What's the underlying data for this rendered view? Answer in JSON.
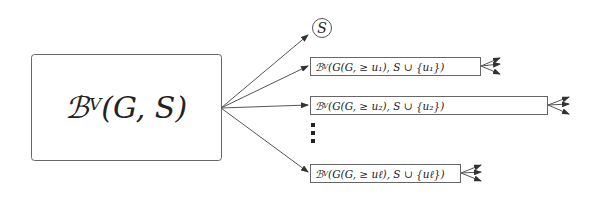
{
  "diagram": {
    "root": {
      "base": "ℬ",
      "superscript": "V",
      "args": " (G, S)"
    },
    "leaf": {
      "label": "S"
    },
    "children": [
      {
        "base": "ℬ",
        "superscript": "V",
        "args": " (G(G, ≥ u₁), S ∪ {u₁})"
      },
      {
        "base": "ℬ",
        "superscript": "V",
        "args": " (G(G, ≥ u₂), S ∪ {u₂})"
      },
      {
        "base": "ℬ",
        "superscript": "V",
        "args": " (G(G, ≥ uℓ), S ∪ {uℓ})"
      }
    ],
    "ellipsis": "⋮",
    "colors": {
      "stroke": "#555555",
      "text": "#222222"
    }
  }
}
